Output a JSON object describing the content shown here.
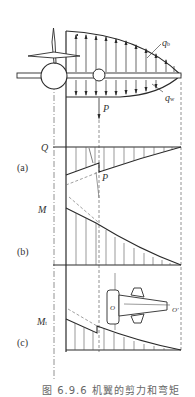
{
  "figure": {
    "caption": "图 6.9.6  机翼的剪力和弯矩",
    "colors": {
      "line": "#2a2a2a",
      "hatch": "#555555",
      "dash": "#777777",
      "background": "#ffffff"
    }
  },
  "labels": {
    "q_upper": {
      "main": "q",
      "sub": "b"
    },
    "q_lower": {
      "main": "q",
      "sub": "w"
    },
    "force": "P",
    "shear_axis": "Q",
    "panel_a": "(a)",
    "bending_axis": "M",
    "panel_b": "(b)",
    "torsion_axis": {
      "main": "M",
      "sub": "t"
    },
    "panel_c": "(c)",
    "force_in_shear": "P",
    "section_o_left": "O",
    "section_o_right": "O'"
  },
  "diagram": {
    "panels": [
      {
        "id": "load",
        "description": "Wing with distributed lift q_b (upward) and weight q_w (downward), concentrated load P from engine"
      },
      {
        "id": "a",
        "description": "Shear force Q diagram with jump at P"
      },
      {
        "id": "b",
        "description": "Bending moment M diagram with kink at P"
      },
      {
        "id": "c",
        "description": "Torsion moment M_t diagram with jump, with wing box section sketch"
      }
    ]
  }
}
